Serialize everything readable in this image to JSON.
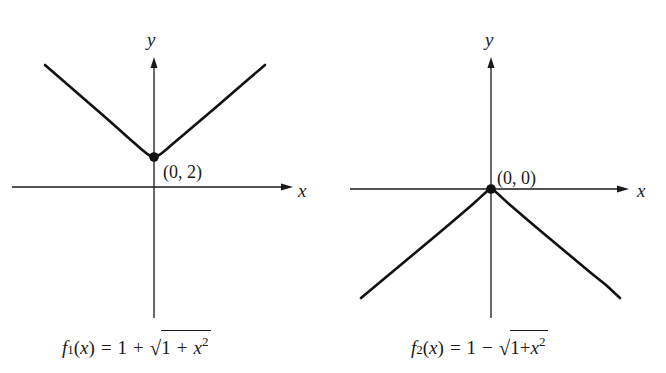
{
  "figure": {
    "left_graph": {
      "y_axis_label": "y",
      "x_axis_label": "x",
      "point_label": "(0, 2)",
      "caption": {
        "func": "f",
        "subscript": "1",
        "arg": "(x)",
        "equals": "=",
        "constant": "1",
        "operator": "+",
        "radicand_const": "1",
        "radicand_op": "+",
        "radicand_var": "x",
        "radicand_exp": "2"
      }
    },
    "right_graph": {
      "y_axis_label": "y",
      "x_axis_label": "x",
      "point_label": "(0, 0)",
      "caption": {
        "func": "f",
        "subscript": "2",
        "arg": "(x)",
        "equals": "=",
        "constant": "1",
        "operator": "−",
        "radicand_const": "1",
        "radicand_op": "+",
        "radicand_var": "x",
        "radicand_exp": "2"
      }
    },
    "colors": {
      "ink": "#1a1a1a",
      "background": "#ffffff"
    }
  }
}
